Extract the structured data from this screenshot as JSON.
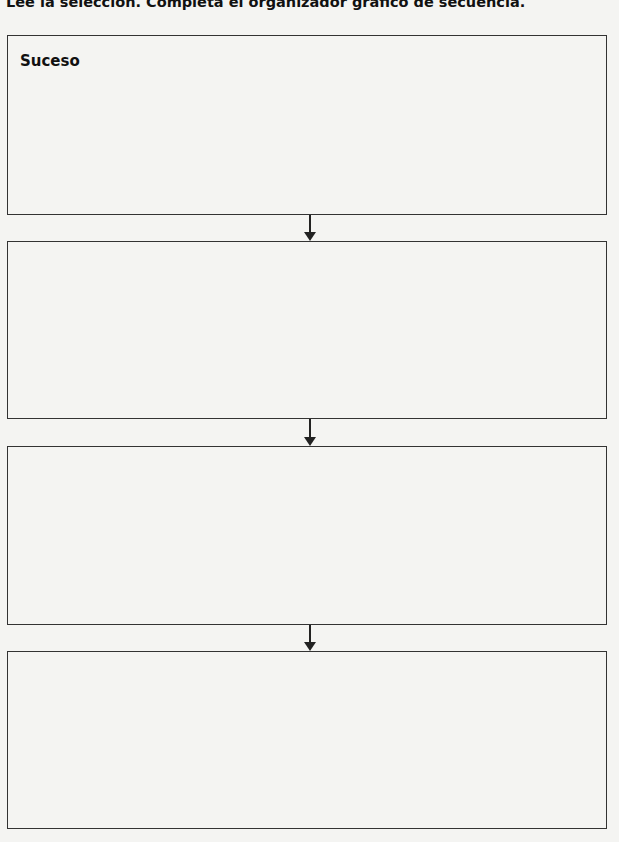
{
  "instructions": "Lee la selección. Completa el organizador gráfico de secuencia.",
  "organizer": {
    "type": "sequence",
    "boxes": [
      {
        "label": "Suceso",
        "content": ""
      },
      {
        "label": "",
        "content": ""
      },
      {
        "label": "",
        "content": ""
      },
      {
        "label": "",
        "content": ""
      }
    ],
    "arrow_icon": "down-arrow-icon"
  }
}
